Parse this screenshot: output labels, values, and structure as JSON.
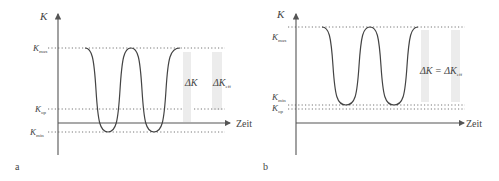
{
  "panels": [
    {
      "id": "a",
      "panel_label": "a",
      "y_axis_label": "K",
      "x_axis_label": "Zeit",
      "levels": {
        "max": {
          "base": "K",
          "sub": "max"
        },
        "op": {
          "base": "K",
          "sub": "op"
        },
        "min": {
          "base": "K",
          "sub": "min"
        }
      },
      "annotations": [
        {
          "base": "ΔK",
          "sub": ""
        },
        {
          "base": "ΔK",
          "sub": "eff"
        }
      ]
    },
    {
      "id": "b",
      "panel_label": "b",
      "y_axis_label": "K",
      "x_axis_label": "Zeit",
      "levels": {
        "max": {
          "base": "K",
          "sub": "max"
        },
        "min": {
          "base": "K",
          "sub": "min"
        },
        "op": {
          "base": "K",
          "sub": "op"
        }
      },
      "annotation_text": {
        "left": "ΔK",
        "eq": "=",
        "right": "ΔK",
        "right_sub": "eff"
      }
    }
  ],
  "colors": {
    "line": "#444444",
    "band": "#ececec",
    "dotted": "#777777"
  }
}
